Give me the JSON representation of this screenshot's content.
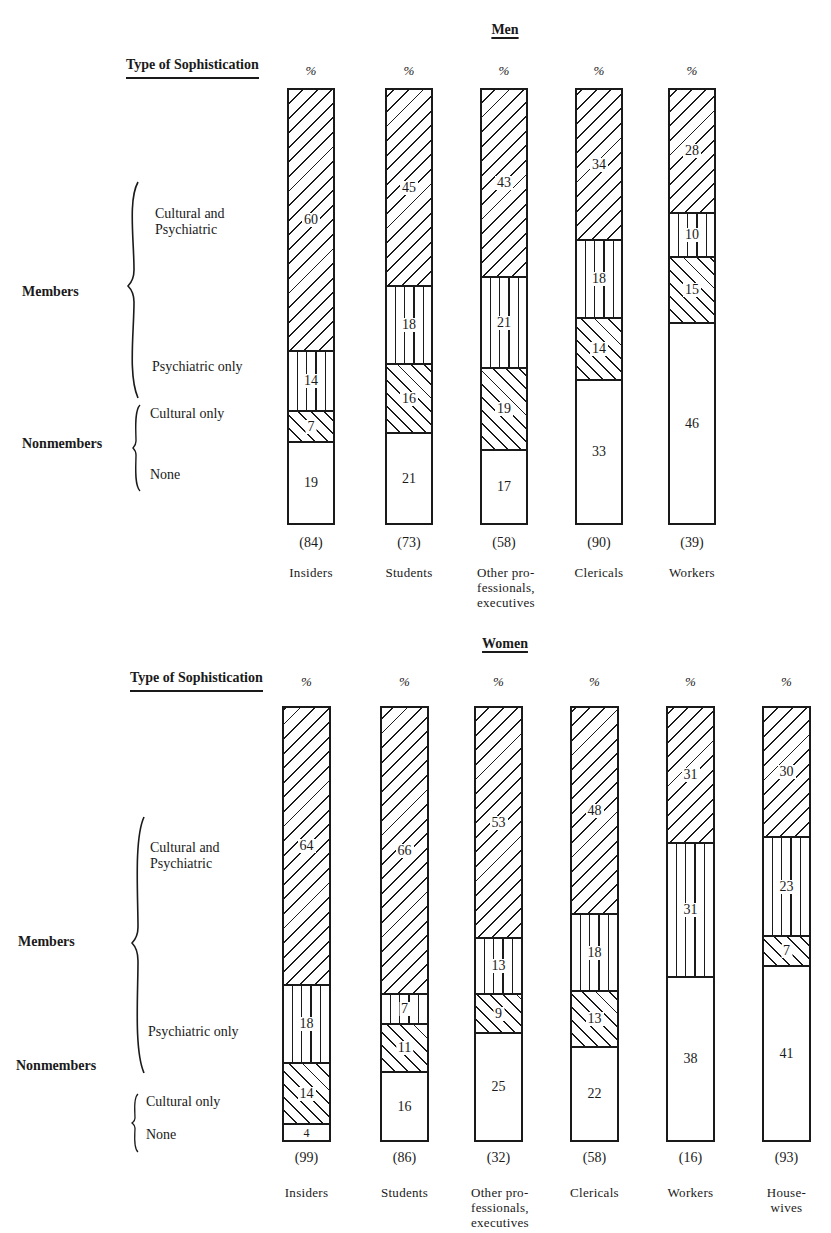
{
  "axis": {
    "type_label": "Type of Sophistication",
    "percent_symbol": "%",
    "group_members": "Members",
    "group_nonmembers": "Nonmembers",
    "categories": {
      "cultural_psychiatric": "Cultural and\nPsychiatric",
      "psychiatric_only": "Psychiatric only",
      "cultural_only": "Cultural only",
      "none": "None"
    }
  },
  "charts": {
    "men": {
      "title": "Men",
      "bars": [
        {
          "label": "Insiders",
          "n": "(84)",
          "values": [
            60,
            14,
            7,
            19
          ]
        },
        {
          "label": "Students",
          "n": "(73)",
          "values": [
            45,
            18,
            16,
            21
          ]
        },
        {
          "label": "Other pro-\nfessionals,\nexecutives",
          "n": "(58)",
          "values": [
            43,
            21,
            19,
            17
          ]
        },
        {
          "label": "Clericals",
          "n": "(90)",
          "values": [
            34,
            18,
            14,
            33
          ]
        },
        {
          "label": "Workers",
          "n": "(39)",
          "values": [
            28,
            10,
            15,
            46
          ]
        }
      ]
    },
    "women": {
      "title": "Women",
      "bars": [
        {
          "label": "Insiders",
          "n": "(99)",
          "values": [
            64,
            18,
            14,
            4
          ]
        },
        {
          "label": "Students",
          "n": "(86)",
          "values": [
            66,
            7,
            11,
            16
          ]
        },
        {
          "label": "Other pro-\nfessionals,\nexecutives",
          "n": "(32)",
          "values": [
            53,
            13,
            9,
            25
          ]
        },
        {
          "label": "Clericals",
          "n": "(58)",
          "values": [
            48,
            18,
            13,
            22
          ]
        },
        {
          "label": "Workers",
          "n": "(16)",
          "values": [
            31,
            31,
            0,
            38
          ]
        },
        {
          "label": "House-\nwives",
          "n": "(93)",
          "values": [
            30,
            23,
            7,
            41
          ]
        }
      ]
    }
  },
  "chart_data": [
    {
      "type": "bar",
      "stacked": true,
      "title": "Men",
      "xlabel": "",
      "ylabel": "%",
      "ylim": [
        0,
        100
      ],
      "grid": false,
      "legend_position": "left (bracketed category labels)",
      "categories": [
        "Insiders",
        "Students",
        "Other professionals, executives",
        "Clericals",
        "Workers"
      ],
      "sample_sizes": [
        84,
        73,
        58,
        90,
        39
      ],
      "series": [
        {
          "name": "Cultural and Psychiatric",
          "group": "Members",
          "pattern": "forward diagonal hatch",
          "values": [
            60,
            45,
            43,
            34,
            28
          ]
        },
        {
          "name": "Psychiatric only",
          "group": "Members",
          "pattern": "vertical hatch",
          "values": [
            14,
            18,
            21,
            18,
            10
          ]
        },
        {
          "name": "Cultural only",
          "group": "Nonmembers",
          "pattern": "backward diagonal hatch",
          "values": [
            7,
            16,
            19,
            14,
            15
          ]
        },
        {
          "name": "None",
          "group": "Nonmembers",
          "pattern": "blank",
          "values": [
            19,
            21,
            17,
            33,
            46
          ]
        }
      ]
    },
    {
      "type": "bar",
      "stacked": true,
      "title": "Women",
      "xlabel": "",
      "ylabel": "%",
      "ylim": [
        0,
        100
      ],
      "grid": false,
      "legend_position": "left (bracketed category labels)",
      "categories": [
        "Insiders",
        "Students",
        "Other professionals, executives",
        "Clericals",
        "Workers",
        "Housewives"
      ],
      "sample_sizes": [
        99,
        86,
        32,
        58,
        16,
        93
      ],
      "series": [
        {
          "name": "Cultural and Psychiatric",
          "group": "Members",
          "pattern": "forward diagonal hatch",
          "values": [
            64,
            66,
            53,
            48,
            31,
            30
          ]
        },
        {
          "name": "Psychiatric only",
          "group": "Members",
          "pattern": "vertical hatch",
          "values": [
            18,
            7,
            13,
            18,
            31,
            23
          ]
        },
        {
          "name": "Cultural only",
          "group": "Nonmembers",
          "pattern": "backward diagonal hatch",
          "values": [
            14,
            11,
            9,
            13,
            0,
            7
          ]
        },
        {
          "name": "None",
          "group": "Nonmembers",
          "pattern": "blank",
          "values": [
            4,
            16,
            25,
            22,
            38,
            41
          ]
        }
      ]
    }
  ]
}
